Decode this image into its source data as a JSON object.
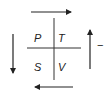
{
  "diagram": {
    "type": "thermodynamic-square",
    "cells": {
      "top_left": "P",
      "top_right": "T",
      "bottom_left": "S",
      "bottom_right": "V"
    },
    "arrows": {
      "top": "right",
      "right": "up",
      "bottom": "left",
      "left": "down"
    },
    "sign_label": "−",
    "colors": {
      "line": "#222222",
      "background": "#ffffff"
    }
  }
}
